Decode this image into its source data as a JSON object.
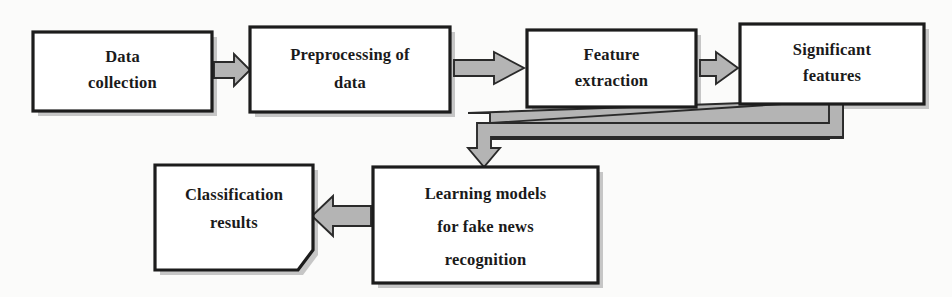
{
  "diagram": {
    "background_color": "#fbfbfa",
    "box_fill_color": "#ffffff",
    "box_border_color": "#1c1c1c",
    "arrow_fill_color": "#b4b4b4",
    "arrow_border_color": "#2a2a2a",
    "text_color": "#1a1a1a",
    "nodes": [
      {
        "id": "data-collection",
        "shape": "rectangle",
        "lines": [
          "Data",
          "collection"
        ],
        "x": 33,
        "y": 32,
        "w": 179,
        "h": 79
      },
      {
        "id": "preprocessing-of-data",
        "shape": "rectangle",
        "lines": [
          "Preprocessing of",
          "data"
        ],
        "x": 250,
        "y": 27,
        "w": 200,
        "h": 85
      },
      {
        "id": "feature-extraction",
        "shape": "rectangle",
        "lines": [
          "Feature",
          "extraction"
        ],
        "x": 527,
        "y": 30,
        "w": 169,
        "h": 77
      },
      {
        "id": "significant-features",
        "shape": "rectangle",
        "lines": [
          "Significant",
          "features"
        ],
        "x": 740,
        "y": 24,
        "w": 184,
        "h": 80
      },
      {
        "id": "learning-models",
        "shape": "rectangle",
        "lines": [
          "Learning models",
          "for fake news",
          "recognition"
        ],
        "x": 373,
        "y": 167,
        "w": 225,
        "h": 116
      },
      {
        "id": "classification-results",
        "shape": "document-dogear",
        "lines": [
          "Classification",
          "results"
        ],
        "x": 155,
        "y": 165,
        "w": 158,
        "h": 105
      }
    ],
    "connectors": [
      {
        "id": "data-collection-to-preprocessing",
        "type": "block-arrow",
        "direction": "right",
        "from": "data-collection",
        "to": "preprocessing-of-data"
      },
      {
        "id": "preprocessing-to-feature-extraction",
        "type": "block-arrow",
        "direction": "right",
        "from": "preprocessing-of-data",
        "to": "feature-extraction"
      },
      {
        "id": "feature-extraction-to-significant-features",
        "type": "block-arrow",
        "direction": "right",
        "from": "feature-extraction",
        "to": "significant-features"
      },
      {
        "id": "significant-features-to-learning-models",
        "type": "elbow-block-arrow",
        "direction": "down-left-down",
        "from": "significant-features",
        "to": "learning-models"
      },
      {
        "id": "learning-models-to-classification-results",
        "type": "block-arrow",
        "direction": "left",
        "from": "learning-models",
        "to": "classification-results"
      }
    ]
  }
}
